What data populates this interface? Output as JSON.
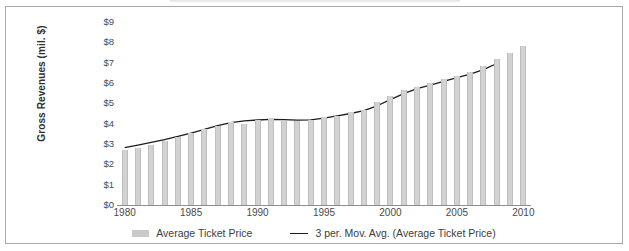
{
  "chart_data": {
    "type": "bar",
    "title": "",
    "subtitle": "",
    "xlabel": "",
    "ylabel": "Gross Revenues (mil. $)",
    "ylim": [
      0,
      9
    ],
    "ytick_labels": [
      "$9",
      "$8",
      "$7",
      "$6",
      "$5",
      "$4",
      "$3",
      "$2",
      "$1",
      "$0"
    ],
    "ytick_values": [
      9,
      8,
      7,
      6,
      5,
      4,
      3,
      2,
      1,
      0
    ],
    "xtick_labels": [
      "1980",
      "1985",
      "1990",
      "1995",
      "2000",
      "2005",
      "2010"
    ],
    "xtick_values": [
      1980,
      1985,
      1990,
      1995,
      2000,
      2005,
      2010
    ],
    "xlim": [
      1980,
      2010
    ],
    "grid": false,
    "legend_position": "bottom",
    "categories": [
      "1980",
      "1981",
      "1982",
      "1983",
      "1984",
      "1985",
      "1986",
      "1987",
      "1988",
      "1989",
      "1990",
      "1991",
      "1992",
      "1993",
      "1994",
      "1995",
      "1996",
      "1997",
      "1998",
      "1999",
      "2000",
      "2001",
      "2002",
      "2003",
      "2004",
      "2005",
      "2006",
      "2007",
      "2008",
      "2009",
      "2010"
    ],
    "series": [
      {
        "name": "Average Ticket Price",
        "type": "bar",
        "color": "#c9c9c9",
        "values": [
          2.7,
          2.78,
          2.94,
          3.14,
          3.34,
          3.56,
          3.72,
          3.88,
          4.1,
          3.99,
          4.2,
          4.22,
          4.14,
          4.12,
          4.16,
          4.34,
          4.4,
          4.58,
          4.68,
          5.06,
          5.38,
          5.64,
          5.78,
          6.02,
          6.2,
          6.36,
          6.52,
          6.86,
          7.16,
          7.46,
          7.84
        ]
      },
      {
        "name": "3 per. Mov. Avg. (Average Ticket Price)",
        "type": "line",
        "color": "#1d1d1d",
        "values": [
          2.82,
          2.95,
          3.08,
          3.22,
          3.37,
          3.54,
          3.72,
          3.9,
          4.05,
          4.14,
          4.18,
          4.21,
          4.2,
          4.17,
          4.19,
          4.27,
          4.38,
          4.5,
          4.64,
          4.88,
          5.18,
          5.48,
          5.72,
          5.9,
          6.08,
          6.26,
          6.44,
          6.66,
          6.96,
          7.26,
          7.54
        ]
      }
    ]
  },
  "legend": {
    "items": [
      {
        "label": "Average Ticket Price",
        "marker": "bar-swatch"
      },
      {
        "label": "3 per. Mov. Avg. (Average Ticket Price)",
        "marker": "line-swatch"
      }
    ]
  }
}
